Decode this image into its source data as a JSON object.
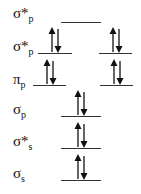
{
  "diagram": {
    "title": "",
    "levels": [
      {
        "id": "sigma_star_p_top",
        "symbol": "σ",
        "star": "*",
        "sub": "p",
        "label_y": 6,
        "line_y": 22,
        "orbitals": [
          {
            "x": 61,
            "w": 40,
            "electrons": "empty"
          }
        ]
      },
      {
        "id": "sigma_star_p",
        "symbol": "σ",
        "star": "*",
        "sub": "p",
        "label_y": 39,
        "line_y": 53,
        "orbitals": [
          {
            "x": 38,
            "w": 34,
            "electrons": "paired"
          },
          {
            "x": 99,
            "w": 33,
            "electrons": "paired"
          }
        ]
      },
      {
        "id": "pi_p",
        "symbol": "π",
        "star": "",
        "sub": "p",
        "label_y": 72,
        "line_y": 85,
        "orbitals": [
          {
            "x": 33,
            "w": 33,
            "electrons": "paired"
          },
          {
            "x": 100,
            "w": 33,
            "electrons": "paired"
          }
        ]
      },
      {
        "id": "sigma_p",
        "symbol": "σ",
        "star": "",
        "sub": "p",
        "label_y": 102,
        "line_y": 116,
        "orbitals": [
          {
            "x": 61,
            "w": 40,
            "electrons": "paired"
          }
        ]
      },
      {
        "id": "sigma_star_s",
        "symbol": "σ",
        "star": "*",
        "sub": "s",
        "label_y": 134,
        "line_y": 148,
        "orbitals": [
          {
            "x": 61,
            "w": 40,
            "electrons": "paired"
          }
        ]
      },
      {
        "id": "sigma_s",
        "symbol": "σ",
        "star": "",
        "sub": "s",
        "label_y": 166,
        "line_y": 180,
        "orbitals": [
          {
            "x": 61,
            "w": 40,
            "electrons": "paired"
          }
        ]
      }
    ],
    "colors": {
      "line": "#333333",
      "arrow": "#111111",
      "text": "#111111"
    }
  }
}
